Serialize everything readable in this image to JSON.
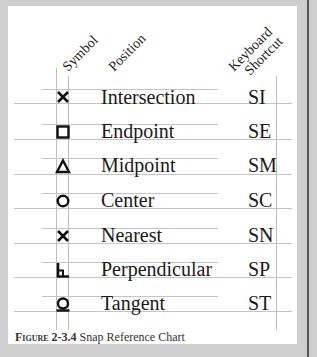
{
  "headers": {
    "symbol": "Symbol",
    "position": "Position",
    "shortcut_line1": "Keyboard",
    "shortcut_line2": "Shortcut"
  },
  "rows": [
    {
      "symbol_icon": "x-mark",
      "position": "Intersection",
      "shortcut": "SI"
    },
    {
      "symbol_icon": "square",
      "position": "Endpoint",
      "shortcut": "SE"
    },
    {
      "symbol_icon": "triangle",
      "position": "Midpoint",
      "shortcut": "SM"
    },
    {
      "symbol_icon": "circle",
      "position": "Center",
      "shortcut": "SC"
    },
    {
      "symbol_icon": "x-mark",
      "position": "Nearest",
      "shortcut": "SN"
    },
    {
      "symbol_icon": "perpendicular",
      "position": "Perpendicular",
      "shortcut": "SP"
    },
    {
      "symbol_icon": "tangent",
      "position": "Tangent",
      "shortcut": "ST"
    }
  ],
  "caption": {
    "label": "Figure 2-3.4",
    "text": "Snap Reference Chart"
  }
}
